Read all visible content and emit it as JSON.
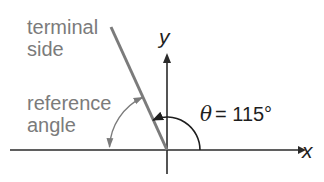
{
  "diagram": {
    "labels": {
      "terminal_side_line1": "terminal",
      "terminal_side_line2": "side",
      "reference_angle_line1": "reference",
      "reference_angle_line2": "angle",
      "theta_symbol": "θ",
      "theta_value": "= 115°",
      "x_axis": "x",
      "y_axis": "y"
    },
    "angle": {
      "theta_degrees": 115,
      "reference_degrees": 65
    },
    "colors": {
      "axes": "#2a2a2a",
      "terminal_side": "#7b7b7b",
      "theta_arc": "#1e1e1e",
      "reference_arc": "#7b7b7b",
      "grey_text": "#7b7b7b",
      "dark_text": "#1e1e1e",
      "background": "#ffffff"
    },
    "icons": {
      "x_axis_arrow": "arrowhead-right-icon",
      "y_axis_arrow": "arrowhead-up-icon",
      "theta_arc_arrow": "arrowhead-left-icon",
      "reference_arc_arrows": "double-arrowhead-icon"
    }
  }
}
